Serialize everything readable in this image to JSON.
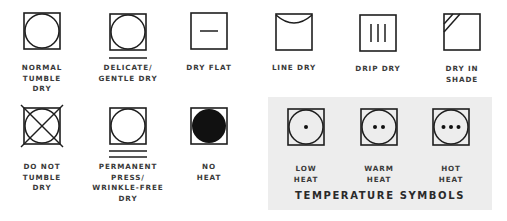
{
  "symbols": [
    {
      "id": "normal-tumble-dry",
      "label": "NORMAL\nTUMBLE\nDRY",
      "icon": "square-circle"
    },
    {
      "id": "delicate-gentle-dry",
      "label": "DELICATE/\nGENTLE DRY",
      "icon": "square-circle-one-line"
    },
    {
      "id": "dry-flat",
      "label": "DRY FLAT",
      "icon": "square-horizontal-line"
    },
    {
      "id": "line-dry",
      "label": "LINE DRY",
      "icon": "square-top-curve"
    },
    {
      "id": "drip-dry",
      "label": "DRIP DRY",
      "icon": "square-three-vertical-lines"
    },
    {
      "id": "dry-in-shade",
      "label": "DRY IN\nSHADE",
      "icon": "square-corner-diagonals"
    },
    {
      "id": "do-not-tumble-dry",
      "label": "DO NOT\nTUMBLE\nDRY",
      "icon": "square-circle-crossed"
    },
    {
      "id": "permanent-press",
      "label": "PERMANENT\nPRESS/\nWRINKLE-FREE\nDRY",
      "icon": "square-circle-two-lines"
    },
    {
      "id": "no-heat",
      "label": "NO\nHEAT",
      "icon": "square-filled-circle"
    },
    {
      "id": "low-heat",
      "label": "LOW\nHEAT",
      "icon": "square-circle-one-dot"
    },
    {
      "id": "warm-heat",
      "label": "WARM\nHEAT",
      "icon": "square-circle-two-dots"
    },
    {
      "id": "hot-heat",
      "label": "HOT\nHEAT",
      "icon": "square-circle-three-dots"
    }
  ],
  "temperature_panel": {
    "title": "TEMPERATURE SYMBOLS",
    "background": "#ededed"
  },
  "colors": {
    "stroke": "#1e1e1e",
    "text": "#3a3a3a"
  }
}
